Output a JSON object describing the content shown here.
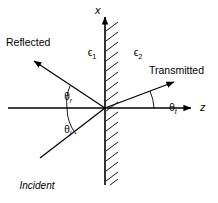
{
  "diagram": {
    "axes": {
      "vertical_label": "x",
      "horizontal_label": "z"
    },
    "media": {
      "left": {
        "symbol": "ϵ",
        "subscript": "1"
      },
      "right": {
        "symbol": "ϵ",
        "subscript": "2"
      }
    },
    "rays": {
      "reflected_label": "Reflected",
      "transmitted_label": "Transmitted",
      "incident_label_lines": [
        "Incident",
        "wave",
        "normal"
      ]
    },
    "angles": {
      "reflected": {
        "symbol": "θ",
        "subscript": "r"
      },
      "incident": {
        "symbol": "θ",
        "subscript": "i"
      },
      "transmitted": {
        "symbol": "θ",
        "subscript": "t"
      }
    },
    "colors": {
      "ink": "#000000",
      "background": "#ffffff"
    }
  }
}
